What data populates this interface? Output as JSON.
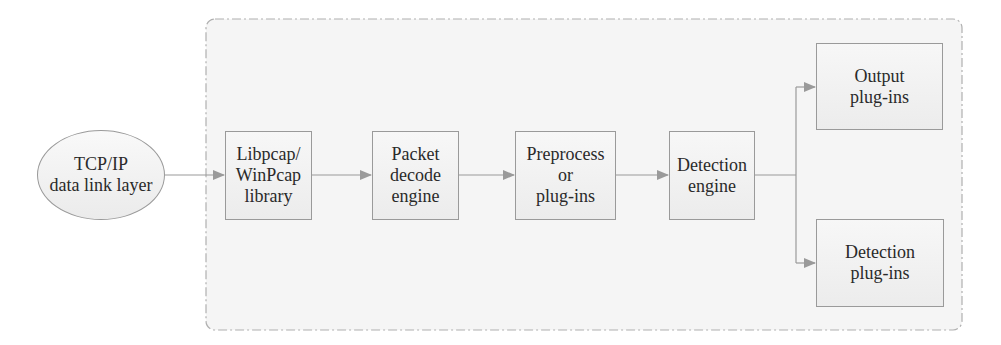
{
  "diagram": {
    "colors": {
      "line": "#9a9a9a",
      "arrow": "#9a9a9a",
      "box_fill_top": "#f7f7f7",
      "box_fill_bottom": "#ececec",
      "container_fill": "#f4f4f4",
      "container_border": "#b0b0b0",
      "text": "#2a2a2a"
    },
    "external_source": {
      "shape": "ellipse",
      "lines": [
        "TCP/IP",
        "data link layer"
      ]
    },
    "pipeline": [
      {
        "id": "libpcap",
        "shape": "rectangle",
        "lines": [
          "Libpcap/",
          "WinPcap",
          "library"
        ]
      },
      {
        "id": "packet-decode",
        "shape": "rectangle",
        "lines": [
          "Packet",
          "decode",
          "engine"
        ]
      },
      {
        "id": "preprocess",
        "shape": "rectangle",
        "lines": [
          "Preprocess",
          "or",
          "plug-ins"
        ]
      },
      {
        "id": "detection-engine",
        "shape": "rectangle",
        "lines": [
          "Detection",
          "engine"
        ]
      }
    ],
    "outputs": [
      {
        "id": "output-plugins",
        "shape": "rectangle",
        "lines": [
          "Output",
          "plug-ins"
        ]
      },
      {
        "id": "detection-plugins",
        "shape": "rectangle",
        "lines": [
          "Detection",
          "plug-ins"
        ]
      }
    ],
    "edges": [
      {
        "from": "external_source",
        "to": "libpcap"
      },
      {
        "from": "libpcap",
        "to": "packet-decode"
      },
      {
        "from": "packet-decode",
        "to": "preprocess"
      },
      {
        "from": "preprocess",
        "to": "detection-engine"
      },
      {
        "from": "detection-engine",
        "to": "output-plugins"
      },
      {
        "from": "detection-engine",
        "to": "detection-plugins"
      }
    ],
    "container": {
      "style": "dash-dot rounded boundary"
    }
  }
}
